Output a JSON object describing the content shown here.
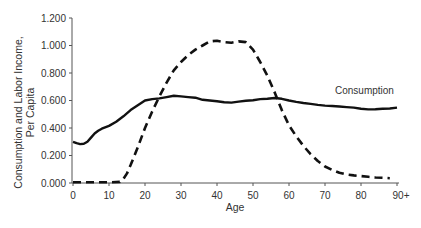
{
  "chart_data": {
    "type": "line",
    "title": "",
    "xlabel": "Age",
    "ylabel_lines": [
      "Consumption and Labor Income,",
      "Per Capita"
    ],
    "xlim": [
      0,
      90
    ],
    "ylim": [
      0,
      1.2
    ],
    "x_ticks": [
      0,
      10,
      20,
      30,
      40,
      50,
      60,
      70,
      80,
      90
    ],
    "x_tick_labels": [
      "0",
      "10",
      "20",
      "30",
      "40",
      "50",
      "60",
      "70",
      "80",
      "90+"
    ],
    "y_ticks": [
      0,
      0.2,
      0.4,
      0.6,
      0.8,
      1.0,
      1.2
    ],
    "y_tick_labels": [
      "0.000",
      "0.200",
      "0.400",
      "0.600",
      "0.800",
      "1.000",
      "1.200"
    ],
    "grid": false,
    "legend": "none",
    "annotations": [
      {
        "text": "Consumption",
        "x": 75,
        "y": 0.64
      }
    ],
    "series": [
      {
        "name": "Consumption",
        "style": "solid",
        "x": [
          0,
          1,
          2,
          3,
          4,
          5,
          6,
          7,
          8,
          10,
          12,
          14,
          16,
          18,
          20,
          22,
          24,
          26,
          28,
          30,
          32,
          34,
          36,
          38,
          40,
          42,
          44,
          46,
          48,
          50,
          52,
          54,
          56,
          58,
          60,
          62,
          64,
          66,
          68,
          70,
          72,
          74,
          76,
          78,
          80,
          82,
          84,
          86,
          88,
          90
        ],
        "values": [
          0.3,
          0.29,
          0.283,
          0.285,
          0.3,
          0.33,
          0.36,
          0.38,
          0.395,
          0.415,
          0.445,
          0.485,
          0.53,
          0.565,
          0.6,
          0.61,
          0.615,
          0.625,
          0.635,
          0.63,
          0.625,
          0.62,
          0.605,
          0.6,
          0.595,
          0.588,
          0.585,
          0.592,
          0.598,
          0.602,
          0.61,
          0.613,
          0.618,
          0.612,
          0.6,
          0.59,
          0.582,
          0.575,
          0.568,
          0.563,
          0.56,
          0.556,
          0.552,
          0.548,
          0.54,
          0.535,
          0.537,
          0.54,
          0.542,
          0.548
        ]
      },
      {
        "name": "Labor Income",
        "style": "dashed",
        "x": [
          0,
          5,
          10,
          13,
          14,
          15,
          16,
          18,
          20,
          22,
          24,
          26,
          28,
          30,
          32,
          34,
          36,
          38,
          40,
          42,
          44,
          46,
          48,
          50,
          52,
          54,
          56,
          58,
          60,
          62,
          64,
          66,
          68,
          70,
          72,
          74,
          76,
          78,
          80,
          82,
          84,
          86,
          88
        ],
        "values": [
          0.005,
          0.005,
          0.005,
          0.008,
          0.03,
          0.07,
          0.13,
          0.26,
          0.4,
          0.52,
          0.63,
          0.73,
          0.82,
          0.88,
          0.93,
          0.97,
          1.0,
          1.03,
          1.035,
          1.025,
          1.02,
          1.03,
          1.025,
          0.97,
          0.88,
          0.78,
          0.66,
          0.53,
          0.42,
          0.34,
          0.27,
          0.21,
          0.16,
          0.12,
          0.095,
          0.075,
          0.062,
          0.055,
          0.05,
          0.045,
          0.04,
          0.038,
          0.035
        ]
      }
    ]
  }
}
